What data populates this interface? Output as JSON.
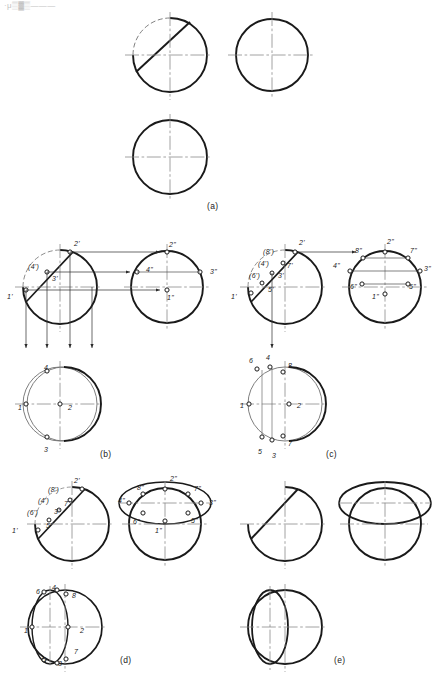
{
  "page": {
    "width": 444,
    "height": 675,
    "background": "#ffffff",
    "header_text": "·μ▒▓▒———",
    "ink": "#1a1a1a",
    "thin_ink": "#6f6f6f",
    "center_line_color": "#7a7a7a"
  },
  "figure": {
    "type": "orthographic-projection-construction",
    "plate_labels": [
      {
        "id": "a",
        "text": "(a)",
        "x": 215,
        "y": 207
      },
      {
        "id": "b",
        "text": "(b)",
        "x": 106,
        "y": 455
      },
      {
        "id": "c",
        "text": "(c)",
        "x": 332,
        "y": 455
      },
      {
        "id": "d",
        "text": "(d)",
        "x": 126,
        "y": 660
      },
      {
        "id": "e",
        "text": "(e)",
        "x": 340,
        "y": 660
      }
    ]
  },
  "panels": {
    "a": {
      "caption": "(a)",
      "description": "Given: front view with cutting chord, side view and top view as plain circles",
      "views": [
        {
          "name": "front-view",
          "cx": 170,
          "cy": 55,
          "r": 37,
          "has_chord": true
        },
        {
          "name": "side-view",
          "cx": 272,
          "cy": 55,
          "r": 36,
          "has_chord": false
        },
        {
          "name": "top-view",
          "cx": 170,
          "cy": 157,
          "r": 37,
          "has_chord": false
        }
      ]
    },
    "b": {
      "caption": "(b)",
      "description": "Four key points 1-4 located and projected between views",
      "front_labels": [
        "2'",
        "(4')",
        "3'",
        "1'"
      ],
      "side_labels": [
        "2\"",
        "4\"",
        "3\"",
        "1\""
      ],
      "top_labels": [
        "4",
        "1",
        "2",
        "3"
      ]
    },
    "c": {
      "caption": "(c)",
      "description": "Eight points 1-8 located, intermediate points added by auxiliary chords",
      "front_labels": [
        "2'",
        "(8')",
        "(4')",
        "7'",
        "(6')",
        "3'",
        "5'",
        "1'"
      ],
      "side_labels": [
        "2\"",
        "8\"",
        "7\"",
        "4\"",
        "3\"",
        "6\"",
        "5\"",
        "1\""
      ],
      "top_labels": [
        "6",
        "4",
        "8",
        "1",
        "2",
        "5",
        "3",
        "7"
      ]
    },
    "d": {
      "caption": "(d)",
      "description": "Smooth elliptical curves drawn through the located points",
      "front_labels": [
        "2'",
        "(8')",
        "(4')",
        "7'",
        "(6')",
        "3'",
        "5'",
        "1'"
      ],
      "side_labels": [
        "2\"",
        "8\"",
        "7\"",
        "4\"",
        "3\"",
        "6\"",
        "5\"",
        "1\""
      ],
      "top_labels": [
        "6",
        "4",
        "8",
        "1",
        "2",
        "5",
        "3",
        "7"
      ]
    },
    "e": {
      "caption": "(e)",
      "description": "Finished three views with construction lines removed",
      "front_labels": [],
      "side_labels": [],
      "top_labels": []
    }
  },
  "point_labels": {
    "b_front": [
      {
        "text": "2'",
        "x": 74,
        "y": 240
      },
      {
        "text": "(4')",
        "x": 28,
        "y": 263
      },
      {
        "text": "3'",
        "x": 52,
        "y": 275
      },
      {
        "text": "1'",
        "x": 7,
        "y": 293
      }
    ],
    "b_side": [
      {
        "text": "2\"",
        "x": 169,
        "y": 241
      },
      {
        "text": "4\"",
        "x": 146,
        "y": 266
      },
      {
        "text": "3\"",
        "x": 210,
        "y": 268
      },
      {
        "text": "1\"",
        "x": 167,
        "y": 294
      }
    ],
    "b_top": [
      {
        "text": "4",
        "x": 44,
        "y": 364
      },
      {
        "text": "1",
        "x": 18,
        "y": 404
      },
      {
        "text": "2",
        "x": 68,
        "y": 404
      },
      {
        "text": "3",
        "x": 44,
        "y": 446
      }
    ],
    "c_front": [
      {
        "text": "2'",
        "x": 299,
        "y": 239
      },
      {
        "text": "(8')",
        "x": 263,
        "y": 248
      },
      {
        "text": "(4')",
        "x": 258,
        "y": 260
      },
      {
        "text": "7'",
        "x": 287,
        "y": 262
      },
      {
        "text": "(6')",
        "x": 249,
        "y": 272
      },
      {
        "text": "3'",
        "x": 278,
        "y": 272
      },
      {
        "text": "5'",
        "x": 268,
        "y": 286
      },
      {
        "text": "1'",
        "x": 231,
        "y": 293
      }
    ],
    "c_side": [
      {
        "text": "2\"",
        "x": 387,
        "y": 238
      },
      {
        "text": "8\"",
        "x": 355,
        "y": 247
      },
      {
        "text": "7\"",
        "x": 410,
        "y": 247
      },
      {
        "text": "4\"",
        "x": 333,
        "y": 262
      },
      {
        "text": "3\"",
        "x": 424,
        "y": 265
      },
      {
        "text": "6\"",
        "x": 350,
        "y": 283
      },
      {
        "text": "5\"",
        "x": 409,
        "y": 283
      },
      {
        "text": "1\"",
        "x": 372,
        "y": 293
      }
    ],
    "c_top": [
      {
        "text": "6",
        "x": 249,
        "y": 357
      },
      {
        "text": "4",
        "x": 266,
        "y": 354
      },
      {
        "text": "8",
        "x": 288,
        "y": 362
      },
      {
        "text": "1",
        "x": 240,
        "y": 402
      },
      {
        "text": "2",
        "x": 297,
        "y": 402
      },
      {
        "text": "5",
        "x": 258,
        "y": 448
      },
      {
        "text": "3",
        "x": 272,
        "y": 452
      },
      {
        "text": "7",
        "x": 288,
        "y": 440
      }
    ],
    "d_front": [
      {
        "text": "2'",
        "x": 74,
        "y": 477
      },
      {
        "text": "(8')",
        "x": 48,
        "y": 486
      },
      {
        "text": "(4')",
        "x": 38,
        "y": 497
      },
      {
        "text": "7'",
        "x": 64,
        "y": 500
      },
      {
        "text": "(6')",
        "x": 27,
        "y": 509
      },
      {
        "text": "3'",
        "x": 54,
        "y": 508
      },
      {
        "text": "5'",
        "x": 46,
        "y": 522
      },
      {
        "text": "1'",
        "x": 12,
        "y": 527
      }
    ],
    "d_side": [
      {
        "text": "2\"",
        "x": 170,
        "y": 475
      },
      {
        "text": "8\"",
        "x": 137,
        "y": 484
      },
      {
        "text": "7\"",
        "x": 194,
        "y": 485
      },
      {
        "text": "4\"",
        "x": 118,
        "y": 497
      },
      {
        "text": "3\"",
        "x": 209,
        "y": 499
      },
      {
        "text": "6\"",
        "x": 133,
        "y": 518
      },
      {
        "text": "5\"",
        "x": 191,
        "y": 517
      },
      {
        "text": "1\"",
        "x": 155,
        "y": 527
      }
    ],
    "d_top": [
      {
        "text": "6",
        "x": 36,
        "y": 588
      },
      {
        "text": "4",
        "x": 52,
        "y": 584
      },
      {
        "text": "8",
        "x": 72,
        "y": 592
      },
      {
        "text": "1",
        "x": 24,
        "y": 627
      },
      {
        "text": "2",
        "x": 80,
        "y": 627
      },
      {
        "text": "5",
        "x": 42,
        "y": 656
      },
      {
        "text": "3",
        "x": 58,
        "y": 660
      },
      {
        "text": "7",
        "x": 74,
        "y": 648
      }
    ]
  }
}
